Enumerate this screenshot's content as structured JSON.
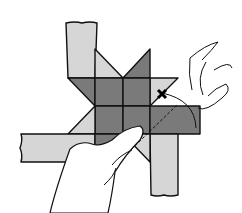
{
  "illustration": {
    "subject": "paper star folding step",
    "colors": {
      "light_paper": "#d6d6d6",
      "dark_paper": "#7a7a7a",
      "outline": "#111111",
      "skin": "#ffffff",
      "background": "#ffffff"
    },
    "elements": [
      "top-strip",
      "left-strip",
      "bottom-strip",
      "right-flap",
      "star-center",
      "star-points",
      "fold-line",
      "fold-arrow",
      "left-hand",
      "right-hand"
    ]
  }
}
